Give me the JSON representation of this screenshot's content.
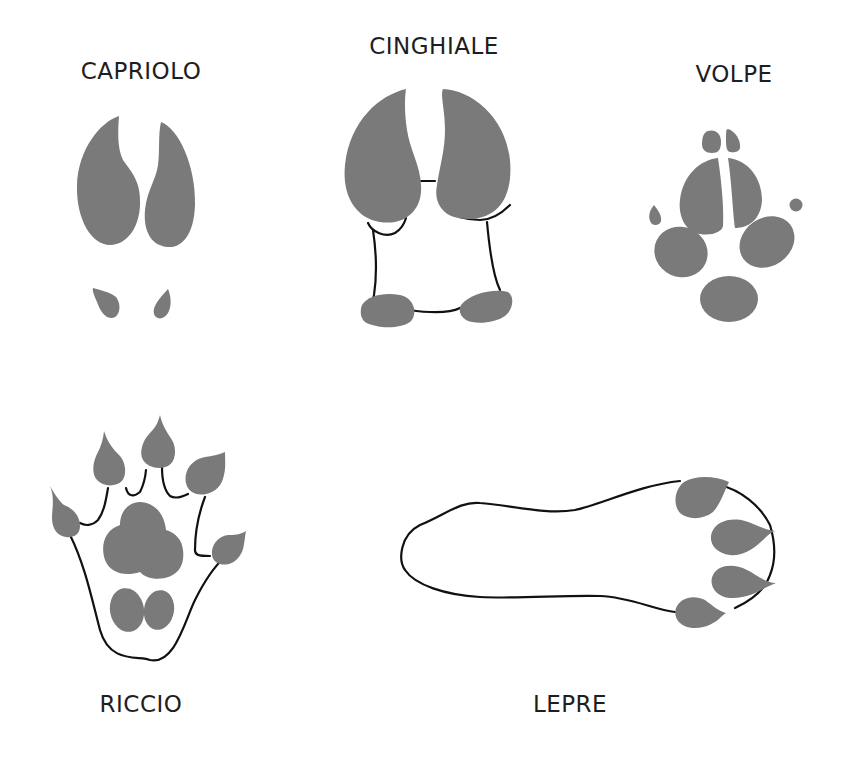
{
  "colors": {
    "background": "#ffffff",
    "pad_fill": "#7a7a7a",
    "outline": "#111111",
    "label_text": "#1e1e1e"
  },
  "footprints": [
    {
      "id": "capriolo",
      "label": "CAPRIOLO"
    },
    {
      "id": "cinghiale",
      "label": "CINGHIALE"
    },
    {
      "id": "volpe",
      "label": "VOLPE"
    },
    {
      "id": "riccio",
      "label": "RICCIO"
    },
    {
      "id": "lepre",
      "label": "LEPRE"
    }
  ]
}
